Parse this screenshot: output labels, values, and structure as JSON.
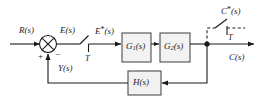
{
  "diagram": {
    "line_color": "#1a1a1a",
    "block_fill": "#f2f2f2",
    "block_stroke": "#4d4d4d",
    "signals": {
      "input": "R(s)",
      "error": "E(s)",
      "sampled_error_base": "E",
      "sampled_error_star": "*",
      "sampled_error_arg": "(s)",
      "feedback": "Y(s)",
      "output": "C(s)",
      "sampled_output_base": "C",
      "sampled_output_star": "*",
      "sampled_output_arg": "(s)"
    },
    "summing_junction": {
      "name": "summing-junction",
      "plus_sign": "+",
      "minus_sign": "−"
    },
    "blocks": [
      {
        "id": "g1",
        "base": "G",
        "sub": "1",
        "arg": "(s)",
        "label": "G1(s)"
      },
      {
        "id": "g2",
        "base": "G",
        "sub": "2",
        "arg": "(s)",
        "label": "G2(s)"
      },
      {
        "id": "h",
        "base": "H",
        "sub": "",
        "arg": "(s)",
        "label": "H(s)"
      }
    ],
    "samplers": [
      {
        "id": "error-sampler",
        "period_label": "T",
        "signal_out": "E*(s)"
      },
      {
        "id": "output-sampler",
        "period_label": "T",
        "signal_out": "C*(s)"
      }
    ]
  }
}
